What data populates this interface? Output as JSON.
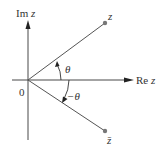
{
  "diagram": {
    "axes": {
      "imag_label": "Im",
      "imag_var": "z",
      "real_label": "Re",
      "real_var": "z",
      "origin_label": "0"
    },
    "points": [
      {
        "name": "z",
        "label": "z"
      },
      {
        "name": "z-conjugate",
        "label": "z̄"
      }
    ],
    "angles": [
      {
        "name": "theta",
        "label": "θ"
      },
      {
        "name": "neg-theta",
        "label": "−θ"
      }
    ],
    "colors": {
      "axis": "#333333",
      "ray": "#555555",
      "point": "#777777"
    }
  }
}
